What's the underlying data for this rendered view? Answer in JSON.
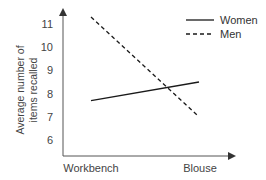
{
  "chart_data": {
    "type": "line",
    "title": "",
    "xlabel": "",
    "ylabel": "Average number of items recalled",
    "ylabel_lines": [
      "Average number of",
      "items recalled"
    ],
    "categories": [
      "Workbench",
      "Blouse"
    ],
    "yticks": [
      6,
      7,
      8,
      9,
      10,
      11
    ],
    "ylim": [
      5.3,
      11.6
    ],
    "grid": false,
    "legend_position": "top-right",
    "series": [
      {
        "name": "Women",
        "style": "solid",
        "color": "#1a1a1a",
        "values": [
          7.7,
          8.5
        ]
      },
      {
        "name": "Men",
        "style": "dashed",
        "color": "#1a1a1a",
        "values": [
          11.3,
          7.0
        ]
      }
    ]
  }
}
